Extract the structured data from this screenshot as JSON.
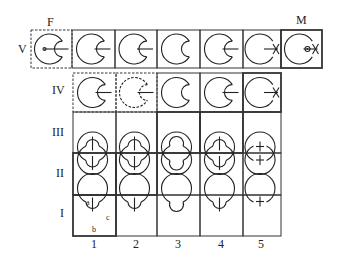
{
  "row_labels": [
    "V",
    "IV",
    "III",
    "II",
    "I"
  ],
  "column_labels": [
    "1",
    "2",
    "3",
    "4",
    "5"
  ],
  "top_labels": {
    "left": "F",
    "right": "M"
  },
  "cell_letters": {
    "a": "a",
    "b": "b",
    "c": "c"
  },
  "rows": [
    {
      "label": "V",
      "cells": [
        {
          "id": "F",
          "style": "dashed",
          "form": "side-stem-inner"
        },
        {
          "id": "1",
          "style": "solid",
          "form": "side-small"
        },
        {
          "id": "2",
          "style": "solid",
          "form": "side-small"
        },
        {
          "id": "3",
          "style": "solid",
          "form": "side-bud"
        },
        {
          "id": "4",
          "style": "solid",
          "form": "side-small"
        },
        {
          "id": "5",
          "style": "solid",
          "form": "side-stem-cross"
        },
        {
          "id": "M",
          "style": "thick",
          "form": "side-dot-cross"
        }
      ]
    },
    {
      "label": "IV",
      "cells": [
        {
          "id": "1",
          "style": "dashed",
          "form": "side-small"
        },
        {
          "id": "2",
          "style": "dashed",
          "form": "side-small-dashed"
        },
        {
          "id": "3",
          "style": "solid",
          "form": "side-bud"
        },
        {
          "id": "4",
          "style": "solid",
          "form": "side-small"
        },
        {
          "id": "5",
          "style": "thick",
          "form": "side-stem-cross"
        }
      ]
    },
    {
      "label": "III",
      "cells": [
        {
          "id": "1",
          "style": "solid",
          "form": "bottom-small"
        },
        {
          "id": "2",
          "style": "solid",
          "form": "bottom-small"
        },
        {
          "id": "3",
          "style": "thick",
          "form": "bottom-bud"
        },
        {
          "id": "4",
          "style": "thick",
          "form": "bottom-small"
        },
        {
          "id": "5",
          "style": "solid",
          "form": "bottom-cross"
        }
      ]
    },
    {
      "label": "II",
      "cells": [
        {
          "id": "1",
          "style": "thick",
          "form": "top-small"
        },
        {
          "id": "2",
          "style": "thick",
          "form": "top-small"
        },
        {
          "id": "3",
          "style": "solid",
          "form": "top-bud"
        },
        {
          "id": "4",
          "style": "solid",
          "form": "top-small"
        },
        {
          "id": "5",
          "style": "solid",
          "form": "top-cross"
        }
      ]
    },
    {
      "label": "I",
      "cells": [
        {
          "id": "1",
          "style": "thick",
          "form": "top-small"
        },
        {
          "id": "2",
          "style": "solid",
          "form": "top-small"
        },
        {
          "id": "3",
          "style": "solid",
          "form": "top-bud"
        },
        {
          "id": "4",
          "style": "solid",
          "form": "top-small"
        },
        {
          "id": "5",
          "style": "solid",
          "form": "top-cross"
        }
      ]
    }
  ]
}
